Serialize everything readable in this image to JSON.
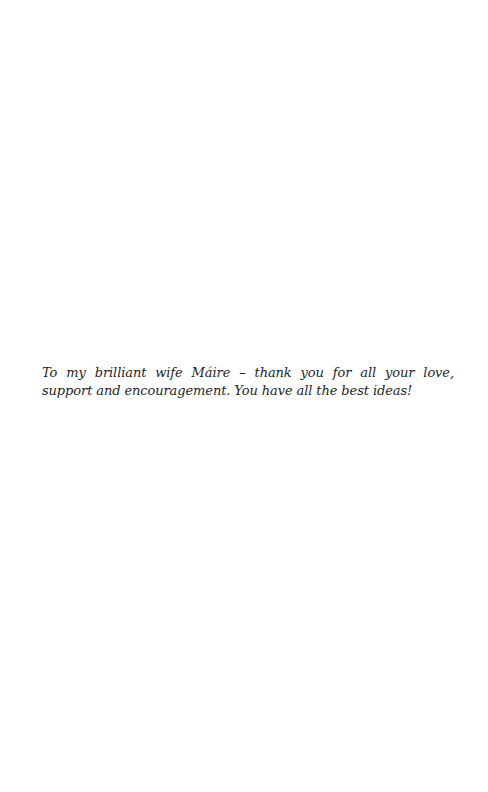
{
  "page": {
    "dedication": {
      "text": "To my brilliant wife Máire – thank you for all your love, support and encouragement. You have all the best ideas!"
    }
  }
}
